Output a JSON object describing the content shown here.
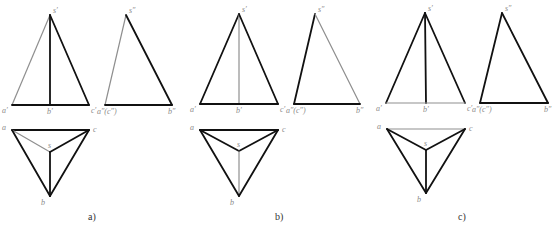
{
  "colors": {
    "visible": "#111111",
    "hidden": "#8f8f8f",
    "label": "#8a8a8a"
  },
  "panels": [
    {
      "id": "a",
      "caption": "a)",
      "caption_pos": [
        88,
        220
      ],
      "front_view": {
        "points": {
          "s": [
            50,
            15
          ],
          "a": [
            12,
            105
          ],
          "b": [
            50,
            105
          ],
          "c": [
            89,
            105
          ]
        },
        "labels": {
          "s": "s′",
          "a": "a′",
          "b": "b′",
          "c": "c′"
        },
        "edges": [
          {
            "from": "s",
            "to": "a",
            "style": "hidden"
          },
          {
            "from": "s",
            "to": "b",
            "style": "visible"
          },
          {
            "from": "s",
            "to": "c",
            "style": "visible"
          },
          {
            "from": "a",
            "to": "c",
            "style": "visible"
          }
        ]
      },
      "side_view": {
        "points": {
          "s": [
            126,
            15
          ],
          "a": [
            105,
            105
          ],
          "b": [
            172,
            105
          ]
        },
        "labels": {
          "s": "s″",
          "a": "a″(c″)",
          "b": "b″"
        },
        "edges": [
          {
            "from": "s",
            "to": "a",
            "style": "hidden"
          },
          {
            "from": "s",
            "to": "b",
            "style": "visible"
          },
          {
            "from": "a",
            "to": "b",
            "style": "visible"
          }
        ]
      },
      "top_view": {
        "points": {
          "a": [
            12,
            130
          ],
          "c": [
            89,
            130
          ],
          "s": [
            50,
            152
          ],
          "b": [
            50,
            196
          ]
        },
        "labels": {
          "a": "a",
          "c": "c",
          "s": "s",
          "b": "b"
        },
        "edges": [
          {
            "from": "a",
            "to": "c",
            "style": "visible"
          },
          {
            "from": "a",
            "to": "s",
            "style": "hidden"
          },
          {
            "from": "s",
            "to": "c",
            "style": "visible"
          },
          {
            "from": "s",
            "to": "b",
            "style": "visible"
          },
          {
            "from": "a",
            "to": "b",
            "style": "visible"
          },
          {
            "from": "c",
            "to": "b",
            "style": "visible"
          }
        ]
      }
    },
    {
      "id": "b",
      "caption": "b)",
      "caption_pos": [
        275,
        220
      ],
      "front_view": {
        "points": {
          "s": [
            239,
            14
          ],
          "a": [
            200,
            104
          ],
          "b": [
            239,
            104
          ],
          "c": [
            278,
            104
          ]
        },
        "labels": {
          "s": "s′",
          "a": "a′",
          "b": "b′",
          "c": "c′"
        },
        "edges": [
          {
            "from": "s",
            "to": "a",
            "style": "visible"
          },
          {
            "from": "s",
            "to": "b",
            "style": "hidden"
          },
          {
            "from": "s",
            "to": "c",
            "style": "visible"
          },
          {
            "from": "a",
            "to": "c",
            "style": "visible"
          }
        ]
      },
      "side_view": {
        "points": {
          "s": [
            315,
            14
          ],
          "a": [
            294,
            104
          ],
          "b": [
            360,
            104
          ]
        },
        "labels": {
          "s": "s″",
          "a": "a″(c″)",
          "b": "b″"
        },
        "edges": [
          {
            "from": "s",
            "to": "a",
            "style": "visible"
          },
          {
            "from": "s",
            "to": "b",
            "style": "hidden"
          },
          {
            "from": "a",
            "to": "b",
            "style": "visible"
          }
        ]
      },
      "top_view": {
        "points": {
          "a": [
            200,
            130
          ],
          "c": [
            278,
            130
          ],
          "s": [
            239,
            151
          ],
          "b": [
            239,
            196
          ]
        },
        "labels": {
          "a": "a",
          "c": "c",
          "s": "s",
          "b": "b"
        },
        "edges": [
          {
            "from": "a",
            "to": "c",
            "style": "visible"
          },
          {
            "from": "a",
            "to": "s",
            "style": "visible"
          },
          {
            "from": "s",
            "to": "c",
            "style": "visible"
          },
          {
            "from": "s",
            "to": "b",
            "style": "hidden"
          },
          {
            "from": "a",
            "to": "b",
            "style": "visible"
          },
          {
            "from": "c",
            "to": "b",
            "style": "visible"
          }
        ]
      }
    },
    {
      "id": "c",
      "caption": "c)",
      "caption_pos": [
        458,
        220
      ],
      "front_view": {
        "points": {
          "s": [
            425,
            13
          ],
          "a": [
            386,
            103
          ],
          "b": [
            426,
            103
          ],
          "c": [
            465,
            103
          ]
        },
        "labels": {
          "s": "s′",
          "a": "a′",
          "b": "b′",
          "c": "c′"
        },
        "edges": [
          {
            "from": "s",
            "to": "a",
            "style": "visible"
          },
          {
            "from": "s",
            "to": "b",
            "style": "visible"
          },
          {
            "from": "s",
            "to": "c",
            "style": "visible"
          },
          {
            "from": "a",
            "to": "c",
            "style": "hidden"
          }
        ]
      },
      "side_view": {
        "points": {
          "s": [
            502,
            13
          ],
          "a": [
            480,
            103
          ],
          "b": [
            548,
            103
          ]
        },
        "labels": {
          "s": "s″",
          "a": "a″(c″)",
          "b": "b″"
        },
        "edges": [
          {
            "from": "s",
            "to": "a",
            "style": "visible"
          },
          {
            "from": "s",
            "to": "b",
            "style": "visible"
          },
          {
            "from": "a",
            "to": "b",
            "style": "visible"
          }
        ]
      },
      "top_view": {
        "points": {
          "a": [
            387,
            129
          ],
          "c": [
            465,
            129
          ],
          "s": [
            426,
            150
          ],
          "b": [
            426,
            193
          ]
        },
        "labels": {
          "a": "a",
          "c": "c",
          "s": "s",
          "b": "b"
        },
        "edges": [
          {
            "from": "a",
            "to": "c",
            "style": "hidden"
          },
          {
            "from": "a",
            "to": "s",
            "style": "visible"
          },
          {
            "from": "s",
            "to": "c",
            "style": "visible"
          },
          {
            "from": "s",
            "to": "b",
            "style": "visible"
          },
          {
            "from": "a",
            "to": "b",
            "style": "visible"
          },
          {
            "from": "c",
            "to": "b",
            "style": "visible"
          }
        ]
      }
    }
  ]
}
